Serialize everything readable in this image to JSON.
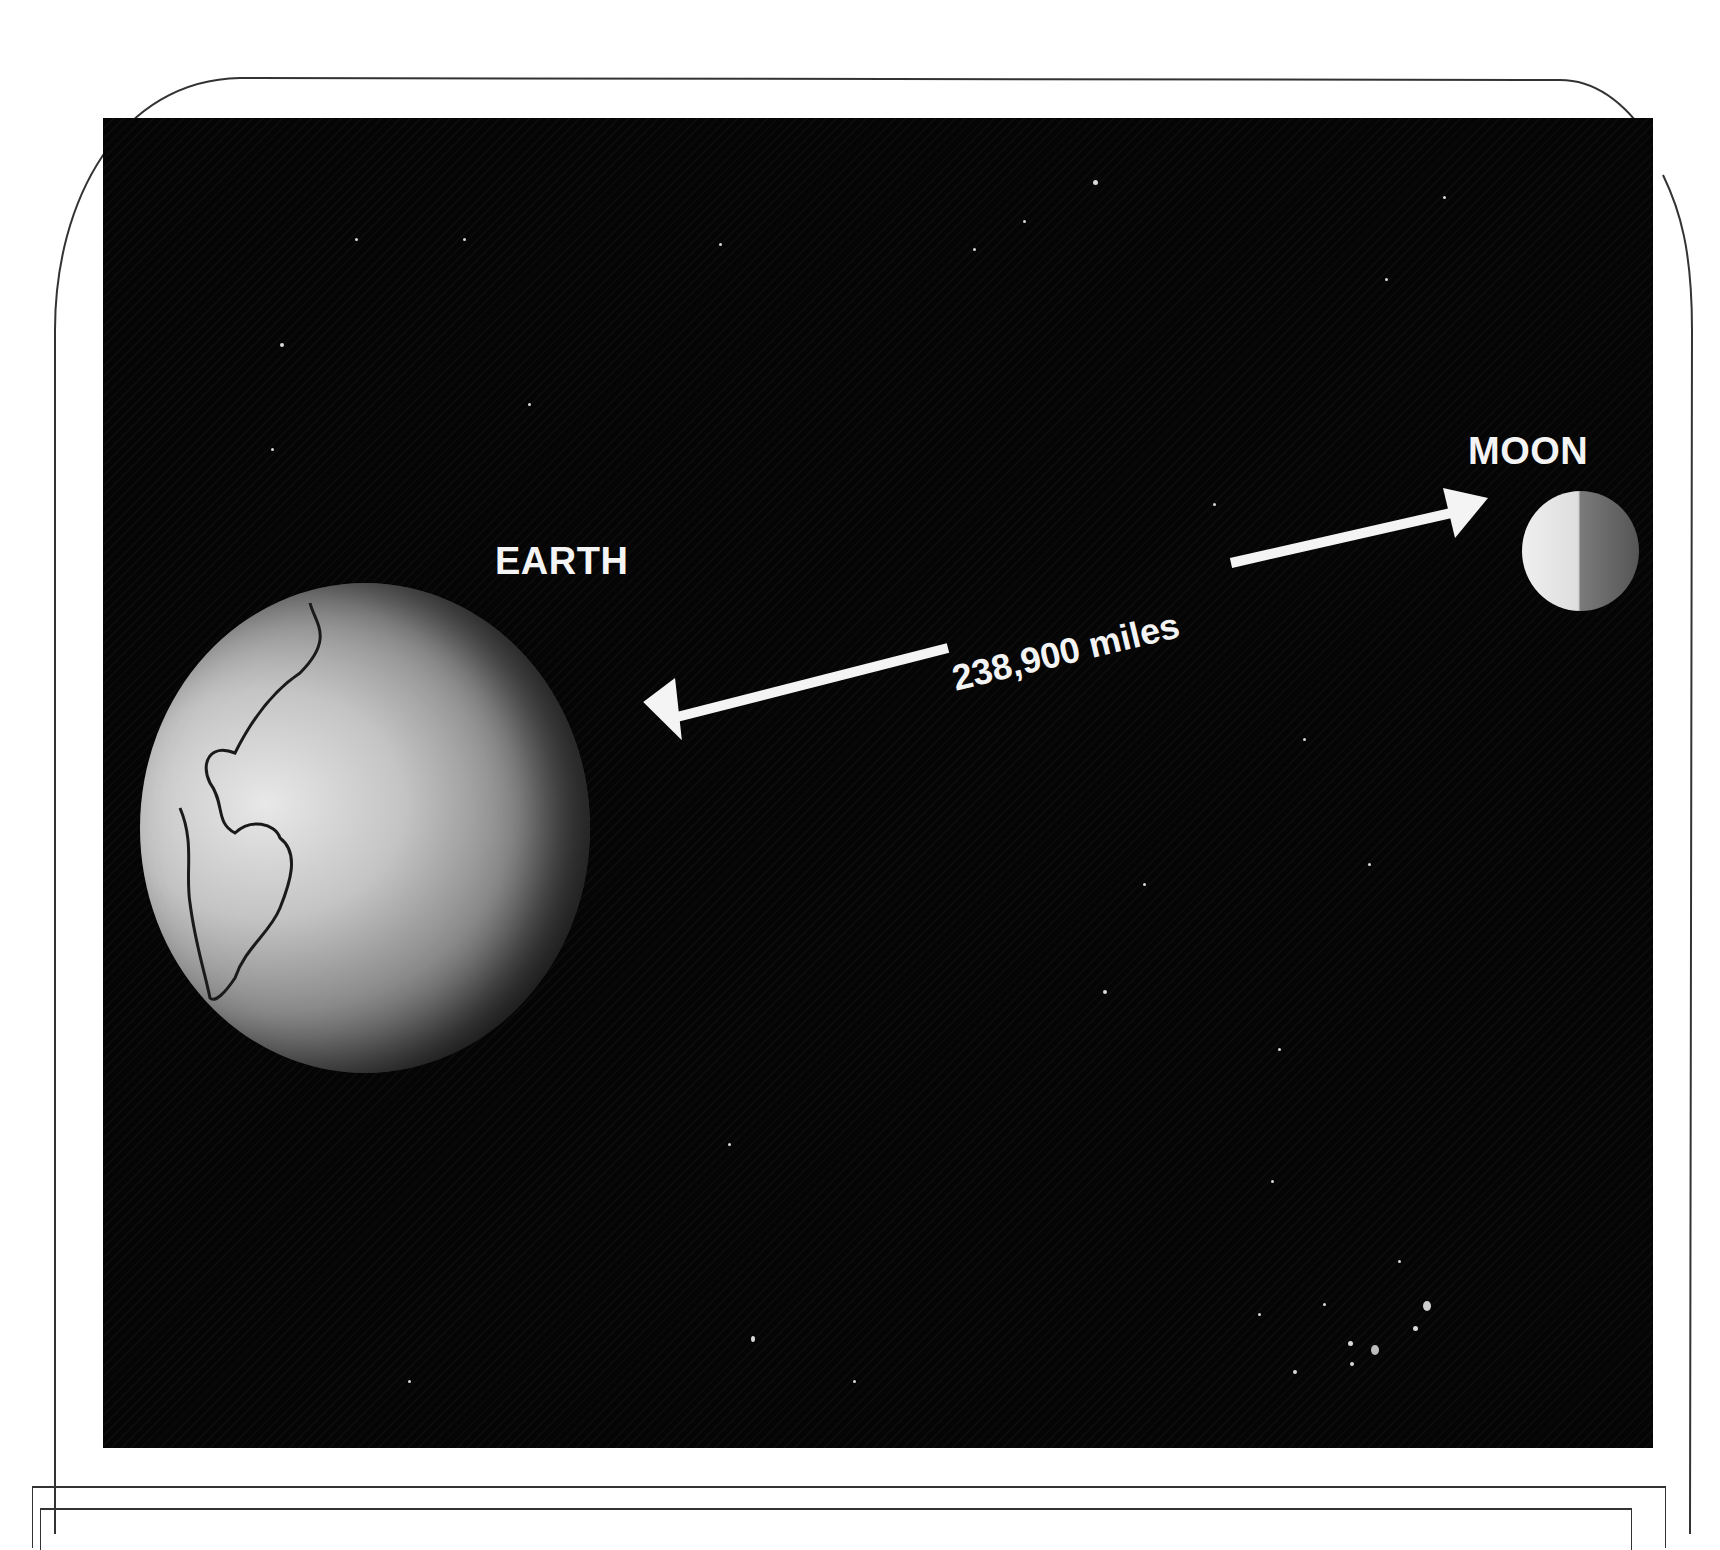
{
  "figure": {
    "labels": {
      "earth": "EARTH",
      "moon": "MOON",
      "distance": "238,900 miles"
    },
    "colors": {
      "background": "#050505",
      "text": "#f4f4f4",
      "arrow": "#f4f4f4",
      "page": "#ffffff"
    },
    "icons": {
      "arrow": "double-headed-arrow"
    }
  }
}
